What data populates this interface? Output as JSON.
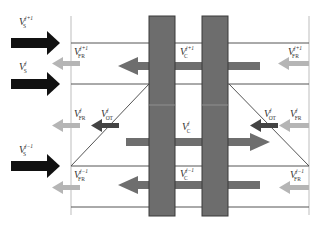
{
  "diagram": {
    "type": "flow-schematic",
    "colors": {
      "background": "#ffffff",
      "column": "#6d6d6d",
      "column_border": "#3a3a3a",
      "supply_arrow": "#111111",
      "cross_arrow": "#6e6e6e",
      "return_arrow": "#b5b5b5",
      "outflow_arrow": "#444444",
      "line": "#555555",
      "boundary": "#c8c8c8"
    },
    "supply_arrows": [
      {
        "id": "s-jp1",
        "label_main": "V",
        "label_sup": "j+1",
        "label_sub": "S"
      },
      {
        "id": "s-j",
        "label_main": "V",
        "label_sup": "j",
        "label_sub": "S"
      },
      {
        "id": "s-jm1",
        "label_main": "V",
        "label_sup": "j−1",
        "label_sub": "S"
      }
    ],
    "return_labels": {
      "left": [
        {
          "main": "V",
          "sup": "j+1",
          "sub": "FR"
        },
        {
          "main": "V",
          "sup": "j",
          "sub": "FR"
        },
        {
          "main": "V",
          "sup": "j−1",
          "sub": "FR"
        }
      ],
      "right": [
        {
          "main": "V",
          "sup": "j+1",
          "sub": "FR"
        },
        {
          "main": "V",
          "sup": "j",
          "sub": "FR"
        },
        {
          "main": "V",
          "sup": "j−1",
          "sub": "FR"
        }
      ]
    },
    "outflow_labels": {
      "left": {
        "main": "V",
        "sup": "j",
        "sub": "OT"
      },
      "right": {
        "main": "V",
        "sup": "j",
        "sub": "OT"
      }
    },
    "center_labels": [
      {
        "main": "V",
        "sup": "j+1",
        "sub": "C"
      },
      {
        "main": "V",
        "sup": "j",
        "sub": "C"
      },
      {
        "main": "V",
        "sup": "j−1",
        "sub": "C"
      }
    ]
  }
}
